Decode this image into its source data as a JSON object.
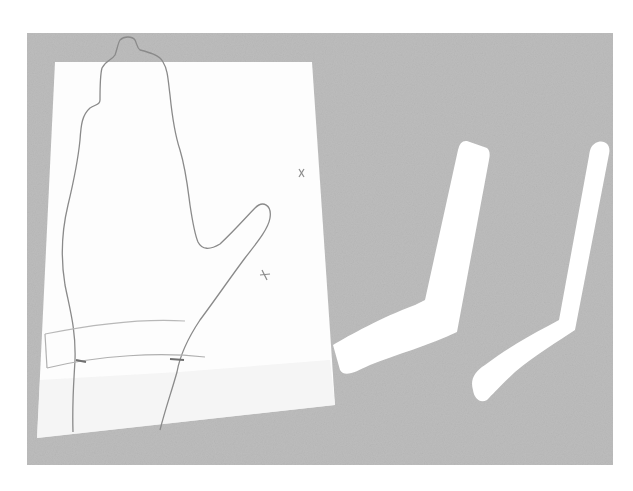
{
  "photo": {
    "description": "Photograph of a hand outline traced on white paper next to two bent white splint strips",
    "colors": {
      "background": "#ffffff",
      "backdrop_gray": "#bdbdbd",
      "backdrop_gray_dark": "#a9a9a9",
      "paper": "#fdfdfd",
      "pencil_line": "#8a8a8a",
      "faint_line": "#b8b8b8",
      "strip": "#ffffff"
    },
    "objects": [
      {
        "name": "paper-sheet",
        "label": "Hand tracing pattern"
      },
      {
        "name": "splint-strip-left",
        "label": "Bent white strip"
      },
      {
        "name": "splint-strip-right",
        "label": "Bent white strip"
      }
    ],
    "marks": [
      "x",
      "x"
    ]
  }
}
